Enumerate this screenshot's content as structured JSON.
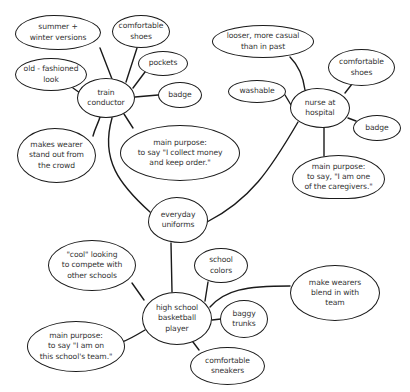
{
  "diagram": {
    "type": "mind-map",
    "center": "everyday uniforms",
    "colors": {
      "stroke": "#1a1a1a",
      "text": "#333333",
      "background": "#ffffff"
    },
    "nodes": [
      {
        "id": "center",
        "label": "everyday\nuniforms",
        "x": 148,
        "y": 197,
        "w": 60,
        "h": 46,
        "r": "48% 52% 45% 55% / 55% 50% 50% 45%"
      },
      {
        "id": "train",
        "label": "train\nconductor",
        "x": 77,
        "y": 78,
        "w": 58,
        "h": 40,
        "r": "50%"
      },
      {
        "id": "t_summer",
        "label": "summer +\nwinter versions",
        "x": 15,
        "y": 15,
        "w": 86,
        "h": 35,
        "r": "45% 55% 50% 50% / 55% 50% 50% 45%"
      },
      {
        "id": "t_oldfash",
        "label": "old - fashioned\nlook",
        "x": 15,
        "y": 58,
        "w": 72,
        "h": 33,
        "r": "50%"
      },
      {
        "id": "t_shoes",
        "label": "comfortable\nshoes",
        "x": 112,
        "y": 15,
        "w": 58,
        "h": 33,
        "r": "50%"
      },
      {
        "id": "t_pockets",
        "label": "pockets",
        "x": 138,
        "y": 51,
        "w": 50,
        "h": 25,
        "r": "50%"
      },
      {
        "id": "t_badge",
        "label": "badge",
        "x": 158,
        "y": 82,
        "w": 44,
        "h": 26,
        "r": "50%"
      },
      {
        "id": "t_standout",
        "label": "makes wearer\nstand out from\nthe crowd",
        "x": 17,
        "y": 128,
        "w": 79,
        "h": 55,
        "r": "48% 52% 50% 50% / 50% 50% 50% 50%"
      },
      {
        "id": "t_purpose",
        "label": "main purpose:\nto say \"I collect money\nand keep order.\"",
        "x": 120,
        "y": 125,
        "w": 120,
        "h": 56,
        "r": "50%"
      },
      {
        "id": "nurse",
        "label": "nurse at\nhospital",
        "x": 290,
        "y": 88,
        "w": 60,
        "h": 40,
        "r": "45% 55% 45% 55% / 50% 50% 50% 50%"
      },
      {
        "id": "n_looser",
        "label": "looser, more casual\nthan in past",
        "x": 212,
        "y": 25,
        "w": 102,
        "h": 33,
        "r": "50%"
      },
      {
        "id": "n_washable",
        "label": "washable",
        "x": 228,
        "y": 80,
        "w": 58,
        "h": 23,
        "r": "50%"
      },
      {
        "id": "n_shoes",
        "label": "comfortable\nshoes",
        "x": 328,
        "y": 49,
        "w": 67,
        "h": 37,
        "r": "50%"
      },
      {
        "id": "n_badge",
        "label": "badge",
        "x": 353,
        "y": 115,
        "w": 48,
        "h": 26,
        "r": "50%"
      },
      {
        "id": "n_purpose",
        "label": "main purpose:\nto say, \"I am one\nof the caregivers.\"",
        "x": 292,
        "y": 155,
        "w": 93,
        "h": 44,
        "r": "50% 50% 40% 40% / 55% 55% 45% 45%"
      },
      {
        "id": "bball",
        "label": "high school\nbasketball\nplayer",
        "x": 142,
        "y": 292,
        "w": 70,
        "h": 53,
        "r": "48% 52% 50% 50% / 50% 50% 50% 50%"
      },
      {
        "id": "b_cool",
        "label": "\"cool\" looking\nto compete with\nother schools",
        "x": 48,
        "y": 240,
        "w": 88,
        "h": 51,
        "r": "50%"
      },
      {
        "id": "b_colors",
        "label": "school\ncolors",
        "x": 194,
        "y": 248,
        "w": 54,
        "h": 35,
        "r": "50%"
      },
      {
        "id": "b_blend",
        "label": "make wearers\nblend in with\nteam",
        "x": 290,
        "y": 265,
        "w": 90,
        "h": 56,
        "r": "50%"
      },
      {
        "id": "b_trunks",
        "label": "baggy\ntrunks",
        "x": 220,
        "y": 300,
        "w": 48,
        "h": 38,
        "r": "50%"
      },
      {
        "id": "b_purpose",
        "label": "main purpose:\nto say \"I am on\nthis school's team.\"",
        "x": 27,
        "y": 321,
        "w": 98,
        "h": 51,
        "r": "50%"
      },
      {
        "id": "b_sneakers",
        "label": "comfortable\nsneakers",
        "x": 190,
        "y": 347,
        "w": 75,
        "h": 38,
        "r": "50%"
      }
    ],
    "edges": [
      {
        "from": "train",
        "to": "center",
        "d": "M112 118 C 100 160, 120 185, 150 212"
      },
      {
        "from": "nurse",
        "to": "center",
        "d": "M298 122 C 270 170, 250 200, 207 222"
      },
      {
        "from": "bball",
        "to": "center",
        "d": "M172 292 L 171 243"
      },
      {
        "from": "train",
        "to": "t_summer",
        "d": "M112 79 L 100 48"
      },
      {
        "from": "train",
        "to": "t_oldfash",
        "d": "M80 93 L 73 88"
      },
      {
        "from": "train",
        "to": "t_shoes",
        "d": "M126 82 L 137 48"
      },
      {
        "from": "train",
        "to": "t_pockets",
        "d": "M133 88 L 145 72"
      },
      {
        "from": "train",
        "to": "t_badge",
        "d": "M135 97 L 158 95"
      },
      {
        "from": "train",
        "to": "t_standout",
        "d": "M100 117 C 98 124, 95 128, 93 136"
      },
      {
        "from": "train",
        "to": "t_purpose",
        "d": "M124 114 L 133 128"
      },
      {
        "from": "nurse",
        "to": "n_looser",
        "d": "M305 90 C 303 75, 298 65, 290 57"
      },
      {
        "from": "nurse",
        "to": "n_washable",
        "d": "M291 105 L 285 95"
      },
      {
        "from": "nurse",
        "to": "n_shoes",
        "d": "M345 93 L 352 84"
      },
      {
        "from": "nurse",
        "to": "n_badge",
        "d": "M348 118 L 356 121"
      },
      {
        "from": "nurse",
        "to": "n_purpose",
        "d": "M324 127 L 324 156"
      },
      {
        "from": "bball",
        "to": "b_cool",
        "d": "M144 300 L 132 283"
      },
      {
        "from": "bball",
        "to": "b_colors",
        "d": "M205 301 L 208 282"
      },
      {
        "from": "bball",
        "to": "b_blend",
        "d": "M210 307 C 225 290, 245 286, 290 286"
      },
      {
        "from": "bball",
        "to": "b_trunks",
        "d": "M212 320 L 221 319"
      },
      {
        "from": "bball",
        "to": "b_purpose",
        "d": "M145 330 C 135 336, 128 340, 122 342"
      },
      {
        "from": "bball",
        "to": "b_sneakers",
        "d": "M193 342 L 199 350"
      }
    ]
  }
}
